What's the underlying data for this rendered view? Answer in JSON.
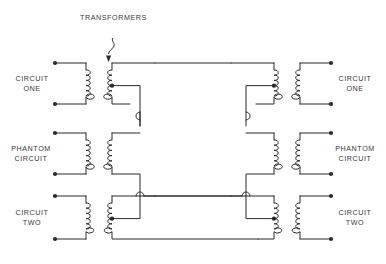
{
  "diagram": {
    "title": "TRANSFORMERS",
    "labels": {
      "left_circuit_one": "CIRCUIT\nONE",
      "left_phantom": "PHANTOM\nCIRCUIT",
      "left_circuit_two": "CIRCUIT\nTWO",
      "right_circuit_one": "CIRCUIT\nONE",
      "right_phantom": "PHANTOM\nCIRCUIT",
      "right_circuit_two": "CIRCUIT\nTWO"
    },
    "colors": {
      "line": "#2b2b2b",
      "text": "#3a3a3a",
      "background": "#ffffff"
    },
    "annotations": {
      "leader": "squiggle-leader-with-arrow",
      "center_taps": 4,
      "wire_hops": 4,
      "terminals": 12,
      "transformers": 6,
      "coils_per_winding": 6
    }
  }
}
